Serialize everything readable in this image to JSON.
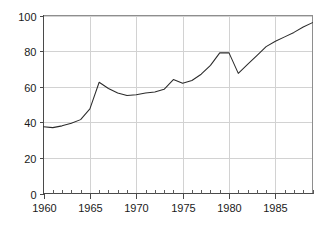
{
  "chart_data": {
    "type": "line",
    "title": "",
    "subtitle": "",
    "xlabel": "",
    "ylabel": "",
    "xlim": [
      1960,
      1989
    ],
    "ylim": [
      0,
      100
    ],
    "grid": true,
    "legend": "none",
    "x_tick_labels": [
      "1960",
      "1965",
      "1970",
      "1975",
      "1980",
      "1985"
    ],
    "x_tick_values": [
      1960,
      1965,
      1970,
      1975,
      1980,
      1985
    ],
    "x_minor_tick_interval": 1,
    "y_tick_labels": [
      "0",
      "20",
      "40",
      "60",
      "80",
      "100"
    ],
    "y_tick_values": [
      0,
      20,
      40,
      60,
      80,
      100
    ],
    "x": [
      1960,
      1961,
      1962,
      1963,
      1964,
      1965,
      1966,
      1967,
      1968,
      1969,
      1970,
      1971,
      1972,
      1973,
      1974,
      1975,
      1976,
      1977,
      1978,
      1979,
      1980,
      1981,
      1982,
      1983,
      1984,
      1985,
      1986,
      1987,
      1988,
      1989
    ],
    "series": [
      {
        "name": "series-1",
        "color": "#2b2b2b",
        "values": [
          37.5,
          37.0,
          38.0,
          39.5,
          41.5,
          47.5,
          62.5,
          59.0,
          56.5,
          55.0,
          55.5,
          56.5,
          57.0,
          58.5,
          64.0,
          62.0,
          63.5,
          67.0,
          72.0,
          79.0,
          79.0,
          67.5,
          72.5,
          77.5,
          82.5,
          85.5,
          88.0,
          90.5,
          93.5,
          96.0
        ]
      }
    ],
    "colors": {
      "line": "#2b2b2b",
      "axis": "#4a4a4a",
      "frame": "#8e8e8e",
      "grid": "#d2d2d2",
      "text": "#1a1a1a",
      "background": "#ffffff"
    }
  }
}
